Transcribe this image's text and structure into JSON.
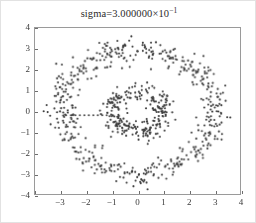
{
  "figure": {
    "title_prefix": "sigma=3.000000",
    "title_times": "×",
    "title_base": "10",
    "title_exponent": "−1",
    "background_color": "#ffffff",
    "frame_color": "#9a9a9a",
    "point_color": "#3b3b3b"
  },
  "chart_data": {
    "type": "scatter",
    "xlabel": "",
    "ylabel": "",
    "xlim": [
      -4,
      4
    ],
    "ylim": [
      -4,
      4
    ],
    "grid": false,
    "legend": null,
    "xticks": [
      -4,
      -3,
      -2,
      -1,
      0,
      1,
      2,
      3,
      4
    ],
    "xticklabels": [
      "",
      "−3",
      "−2",
      "−1",
      "0",
      "1",
      "2",
      "3",
      "4"
    ],
    "yticks": [
      -4,
      -3,
      -2,
      -1,
      0,
      1,
      2,
      3,
      4
    ],
    "yticklabels": [
      "−4",
      "−3",
      "−2",
      "−1",
      "0",
      "1",
      "2",
      "3",
      "4"
    ],
    "marker": "point",
    "marker_size": 1.6,
    "marker_color": "#3b3b3b",
    "noise_sigma": 0.3,
    "series": [
      {
        "name": "inner-ring",
        "shape": "ring",
        "center": [
          0,
          0
        ],
        "radius": 1.0,
        "n_points": 260,
        "noise_sigma": 0.22
      },
      {
        "name": "outer-ring",
        "shape": "ring",
        "center": [
          0,
          0
        ],
        "radius": 3.0,
        "n_points": 520,
        "noise_sigma": 0.28
      },
      {
        "name": "horizontal-artifact-line",
        "shape": "line",
        "y": -0.2,
        "x_start": -2.6,
        "x_end": -1.2,
        "n_points": 9,
        "noise_sigma": 0.0
      }
    ]
  },
  "xtick_labels": [
    "−3",
    "−2",
    "−1",
    "0",
    "1",
    "2",
    "3",
    "4"
  ],
  "ytick_labels": [
    "4",
    "3",
    "2",
    "1",
    "0",
    "−1",
    "−2",
    "−3",
    "−4"
  ]
}
